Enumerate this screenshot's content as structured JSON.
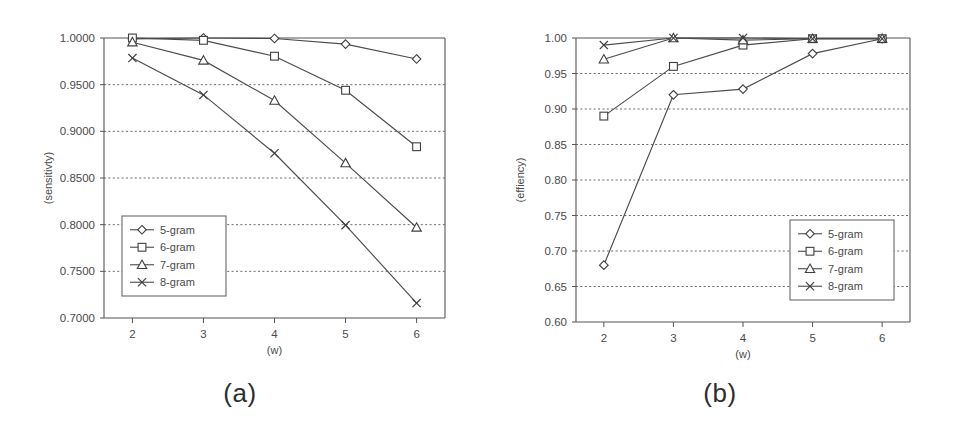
{
  "figure": {
    "panels": [
      {
        "caption": "(a)",
        "ylabel": "(sensitivty)",
        "xlabel": "(w)"
      },
      {
        "caption": "(b)",
        "ylabel": "(effiency)",
        "xlabel": "(w)"
      }
    ]
  },
  "chart_data": [
    {
      "type": "line",
      "title": "(a)",
      "xlabel": "(w)",
      "ylabel": "(sensitivty)",
      "x": [
        2,
        3,
        4,
        5,
        6
      ],
      "xtick_labels": [
        "2",
        "3",
        "4",
        "5",
        "6"
      ],
      "xlim": [
        1.6,
        6.4
      ],
      "ylim": [
        0.7,
        1.0
      ],
      "ytick_labels": [
        "0.7000",
        "0.7500",
        "0.8000",
        "0.8500",
        "0.9000",
        "0.9500",
        "1.0000"
      ],
      "yticks": [
        0.7,
        0.75,
        0.8,
        0.85,
        0.9,
        0.95,
        1.0
      ],
      "grid": true,
      "legend_position": "lower-left",
      "series": [
        {
          "name": "5-gram",
          "marker": "diamond",
          "values": [
            0.999,
            1.0,
            0.9995,
            0.9935,
            0.9775
          ]
        },
        {
          "name": "6-gram",
          "marker": "square",
          "values": [
            1.0,
            0.9975,
            0.9805,
            0.944,
            0.8835
          ]
        },
        {
          "name": "7-gram",
          "marker": "triangle",
          "values": [
            0.9955,
            0.976,
            0.933,
            0.866,
            0.797
          ]
        },
        {
          "name": "8-gram",
          "marker": "cross",
          "values": [
            0.9785,
            0.939,
            0.8765,
            0.7995,
            0.716
          ]
        }
      ]
    },
    {
      "type": "line",
      "title": "(b)",
      "xlabel": "(w)",
      "ylabel": "(effiency)",
      "x": [
        2,
        3,
        4,
        5,
        6
      ],
      "xtick_labels": [
        "2",
        "3",
        "4",
        "5",
        "6"
      ],
      "xlim": [
        1.6,
        6.4
      ],
      "ylim": [
        0.6,
        1.0
      ],
      "ytick_labels": [
        "0.60",
        "0.65",
        "0.70",
        "0.75",
        "0.80",
        "0.85",
        "0.90",
        "0.95",
        "1.00"
      ],
      "yticks": [
        0.6,
        0.65,
        0.7,
        0.75,
        0.8,
        0.85,
        0.9,
        0.95,
        1.0
      ],
      "grid": true,
      "legend_position": "lower-right",
      "series": [
        {
          "name": "5-gram",
          "marker": "diamond",
          "values": [
            0.68,
            0.92,
            0.928,
            0.978,
            0.999
          ]
        },
        {
          "name": "6-gram",
          "marker": "square",
          "values": [
            0.89,
            0.96,
            0.99,
            0.999,
            0.999
          ]
        },
        {
          "name": "7-gram",
          "marker": "triangle",
          "values": [
            0.97,
            1.0,
            0.997,
            0.999,
            0.999
          ]
        },
        {
          "name": "8-gram",
          "marker": "cross",
          "values": [
            0.99,
            1.0,
            1.0,
            0.999,
            0.999
          ]
        }
      ]
    }
  ],
  "legend": {
    "entries": [
      "5-gram",
      "6-gram",
      "7-gram",
      "8-gram"
    ]
  },
  "colors": {
    "ink": "#4a4a4a",
    "axis": "#555555",
    "grid": "#6a6a6a",
    "background": "#ffffff"
  }
}
